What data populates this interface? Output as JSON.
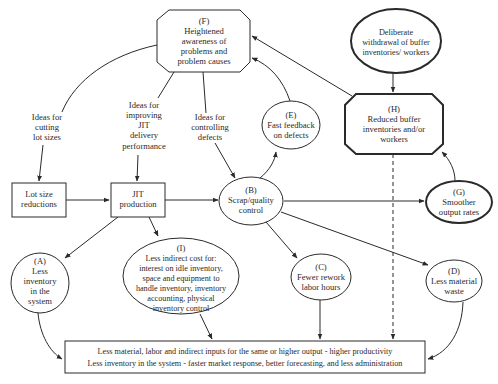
{
  "diagram": {
    "nodes": {
      "F": {
        "label": "(F)",
        "lines": [
          "Heightened",
          "awareness of",
          "problems and",
          "problem causes"
        ]
      },
      "deliberate": {
        "lines": [
          "Deliberate",
          "withdrawal of buffer",
          "inventories/ workers"
        ]
      },
      "H": {
        "label": "(H)",
        "lines": [
          "Reduced buffer",
          "inventories and/or",
          "workers"
        ]
      },
      "E": {
        "label": "(E)",
        "lines": [
          "Fast feedback",
          "on defects"
        ]
      },
      "lot_size": {
        "lines": [
          "Lot size",
          "reductions"
        ]
      },
      "jit": {
        "lines": [
          "JIT",
          "production"
        ]
      },
      "B": {
        "label": "(B)",
        "lines": [
          "Scrap/quality",
          "control"
        ]
      },
      "G": {
        "label": "(G)",
        "lines": [
          "Smoother",
          "output rates"
        ]
      },
      "A": {
        "label": "(A)",
        "lines": [
          "Less",
          "inventory",
          "in the",
          "system"
        ]
      },
      "I": {
        "label": "(I)",
        "lines": [
          "Less indirect cost for:",
          "interest on idle inventory,",
          "space and equipment to",
          "handle inventory, inventory",
          "accounting, physical",
          "inventory control"
        ]
      },
      "C": {
        "label": "(C)",
        "lines": [
          "Fewer rework",
          "labor hours"
        ]
      },
      "D": {
        "label": "(D)",
        "lines": [
          "Less material",
          "waste"
        ]
      },
      "outcome": {
        "lines": [
          "Less material, labor and indirect inputs for the same or higher output - higher productivity",
          "Less inventory in the system - faster market response, better forecasting, and less administration"
        ]
      }
    },
    "edge_labels": {
      "cutting": [
        "Ideas for",
        "cutting",
        "lot sizes"
      ],
      "improving": [
        "Ideas for",
        "improving",
        "JIT",
        "delivery",
        "performance"
      ],
      "controlling": [
        "Ideas for",
        "controlling",
        "defects"
      ]
    }
  }
}
